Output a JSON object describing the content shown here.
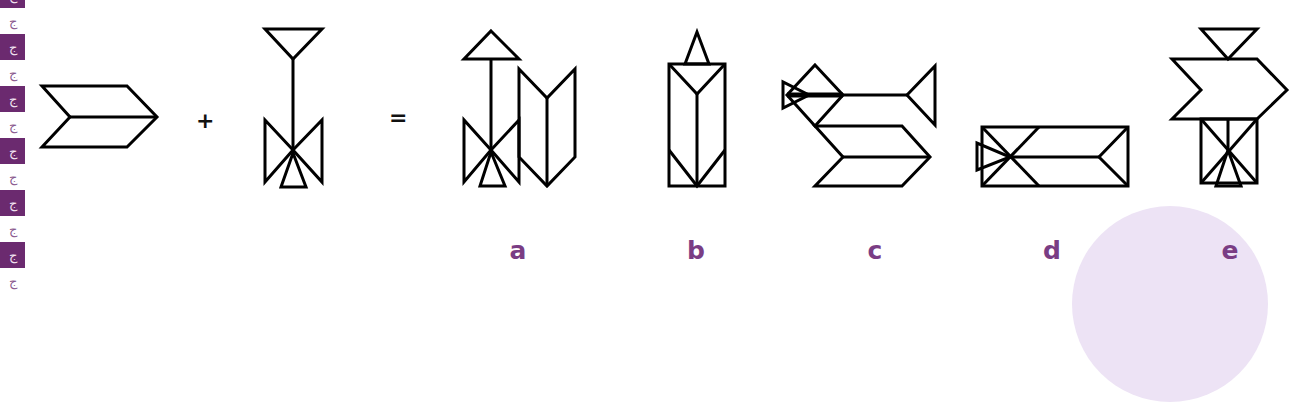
{
  "puzzle": {
    "operators": {
      "plus": "+",
      "equals": "="
    },
    "operand_1": "chevron-arrow-shape",
    "operand_2": "arrow-with-bowtie-shape",
    "options": [
      {
        "label": "a",
        "x": 518
      },
      {
        "label": "b",
        "x": 696
      },
      {
        "label": "c",
        "x": 875
      },
      {
        "label": "d",
        "x": 1052
      },
      {
        "label": "e",
        "x": 1230
      }
    ]
  },
  "colors": {
    "stroke": "#000000",
    "label": "#7a3d84",
    "strip_purple": "#6b2a6f",
    "circle": "#ede3f5"
  },
  "left_strip": {
    "tile_icon": "running-figure-icon",
    "glyph": "ﺝ"
  }
}
